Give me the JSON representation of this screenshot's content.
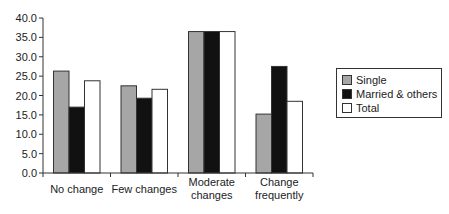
{
  "chart_data": {
    "type": "bar",
    "title": "",
    "xlabel": "",
    "ylabel": "",
    "ylim": [
      0,
      40
    ],
    "yticks": [
      "0.0",
      "5.0",
      "10.0",
      "15.0",
      "20.0",
      "25.0",
      "30.0",
      "35.0",
      "40.0"
    ],
    "categories": [
      "No change",
      "Few changes",
      "Moderate changes",
      "Change frequently"
    ],
    "category_lines": [
      [
        "No change"
      ],
      [
        "Few changes"
      ],
      [
        "Moderate",
        "changes"
      ],
      [
        "Change",
        "frequently"
      ]
    ],
    "series": [
      {
        "name": "Single",
        "color": "#a6a6a6",
        "values": [
          26.3,
          22.5,
          36.5,
          15.2
        ]
      },
      {
        "name": "Married & others",
        "color": "#111111",
        "values": [
          17.0,
          19.3,
          36.5,
          27.5
        ]
      },
      {
        "name": "Total",
        "color": "#ffffff",
        "values": [
          23.8,
          21.6,
          36.5,
          18.5
        ]
      }
    ],
    "grid": false,
    "legend_position": "right"
  },
  "legend": {
    "items": [
      {
        "label": "Single",
        "color": "#a6a6a6"
      },
      {
        "label": "Married & others",
        "color": "#111111"
      },
      {
        "label": "Total",
        "color": "#ffffff"
      }
    ]
  }
}
